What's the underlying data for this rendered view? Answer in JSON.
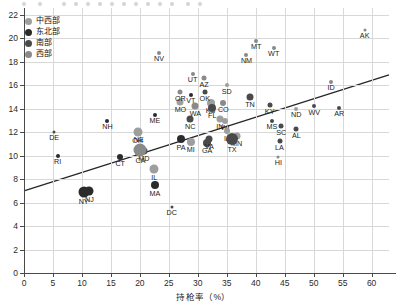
{
  "legend": {
    "position": "top-left",
    "items": [
      {
        "label": "中西部",
        "color": "#9e9e9e",
        "size": 7
      },
      {
        "label": "东北部",
        "color": "#2b2b2b",
        "size": 7
      },
      {
        "label": "南部",
        "color": "#4a4a4a",
        "size": 7
      },
      {
        "label": "西部",
        "color": "#8a8a8a",
        "size": 7
      }
    ]
  },
  "axes": {
    "x": {
      "title": "持枪率（%）",
      "min": 0,
      "max": 63,
      "ticks": [
        0,
        5,
        10,
        15,
        20,
        25,
        30,
        35,
        40,
        45,
        50,
        55,
        60
      ],
      "tick_labels": [
        "0",
        "5",
        "10",
        "15",
        "20",
        "25",
        "30",
        "35",
        "40",
        "45",
        "50",
        "55",
        "60"
      ]
    },
    "y": {
      "title": "",
      "min": 0,
      "max": 22.6,
      "ticks": [
        0,
        2,
        4,
        6,
        8,
        10,
        12,
        14,
        16,
        18,
        20,
        22
      ],
      "tick_labels": [
        "0",
        "2",
        "4",
        "6",
        "8",
        "10",
        "12",
        "14",
        "16",
        "18",
        "20",
        "22"
      ]
    },
    "grid": true
  },
  "trend_line": {
    "x1": 0,
    "y1": 7.0,
    "x2": 63,
    "y2": 16.9,
    "color": "#262626"
  },
  "chart_data": {
    "type": "scatter",
    "title": "",
    "subtitle": "",
    "xlabel": "持枪率（%）",
    "ylabel": "",
    "xlim": [
      0,
      63
    ],
    "ylim": [
      0,
      22.6
    ],
    "grid": true,
    "legend_position": "top-left",
    "trendline": {
      "x": [
        0,
        63
      ],
      "y": [
        7.0,
        16.9
      ]
    },
    "series": [
      {
        "name": "中西部",
        "color": "#9e9e9e",
        "points": [
          {
            "label": "OH",
            "x": 19.6,
            "y": 12.0,
            "size": 9
          },
          {
            "label": "IL",
            "x": 22.5,
            "y": 8.9,
            "size": 9
          },
          {
            "label": "MO",
            "x": 27.0,
            "y": 14.6,
            "size": 7
          },
          {
            "label": "KS",
            "x": 32.2,
            "y": 14.5,
            "size": 8
          },
          {
            "label": "NE",
            "x": 19.8,
            "y": 11.9,
            "size": 5
          },
          {
            "label": "WI",
            "x": 34.7,
            "y": 13.0,
            "size": 6
          },
          {
            "label": "IN",
            "x": 33.8,
            "y": 13.1,
            "size": 7
          },
          {
            "label": "MI",
            "x": 28.8,
            "y": 11.2,
            "size": 8
          },
          {
            "label": "IA",
            "x": 35.1,
            "y": 12.1,
            "size": 6
          },
          {
            "label": "MN",
            "x": 36.7,
            "y": 11.7,
            "size": 7
          },
          {
            "label": "SD",
            "x": 35.0,
            "y": 16.0,
            "size": 4
          },
          {
            "label": "ND",
            "x": 47.0,
            "y": 14.0,
            "size": 4
          }
        ]
      },
      {
        "name": "东北部",
        "color": "#2b2b2b",
        "points": [
          {
            "label": "NY",
            "x": 10.3,
            "y": 6.9,
            "size": 11
          },
          {
            "label": "NJ",
            "x": 11.3,
            "y": 7.0,
            "size": 9
          },
          {
            "label": "MA",
            "x": 22.6,
            "y": 7.5,
            "size": 8
          },
          {
            "label": "CT",
            "x": 16.6,
            "y": 9.9,
            "size": 6
          },
          {
            "label": "RI",
            "x": 5.8,
            "y": 10.0,
            "size": 4
          },
          {
            "label": "NH",
            "x": 14.4,
            "y": 13.0,
            "size": 4
          },
          {
            "label": "ME",
            "x": 22.6,
            "y": 13.5,
            "size": 4
          },
          {
            "label": "VT",
            "x": 28.8,
            "y": 15.2,
            "size": 4
          },
          {
            "label": "PA",
            "x": 27.1,
            "y": 11.4,
            "size": 8
          }
        ]
      },
      {
        "name": "南部",
        "color": "#4a4a4a",
        "points": [
          {
            "label": "TX",
            "x": 35.9,
            "y": 11.4,
            "size": 12
          },
          {
            "label": "FL",
            "x": 32.5,
            "y": 14.1,
            "size": 8
          },
          {
            "label": "GA",
            "x": 31.6,
            "y": 11.1,
            "size": 8
          },
          {
            "label": "NC",
            "x": 28.7,
            "y": 13.1,
            "size": 7
          },
          {
            "label": "VA",
            "x": 32.0,
            "y": 11.4,
            "size": 7
          },
          {
            "label": "TN",
            "x": 39.0,
            "y": 15.0,
            "size": 7
          },
          {
            "label": "MD",
            "x": 20.7,
            "y": 10.4,
            "size": 7
          },
          {
            "label": "DE",
            "x": 5.2,
            "y": 12.0,
            "size": 3
          },
          {
            "label": "OK",
            "x": 31.2,
            "y": 15.4,
            "size": 5
          },
          {
            "label": "KY",
            "x": 42.4,
            "y": 14.3,
            "size": 5
          },
          {
            "label": "SC",
            "x": 44.4,
            "y": 12.5,
            "size": 5
          },
          {
            "label": "AL",
            "x": 47.0,
            "y": 12.3,
            "size": 5
          },
          {
            "label": "MS",
            "x": 42.8,
            "y": 13.0,
            "size": 4
          },
          {
            "label": "LA",
            "x": 44.1,
            "y": 11.3,
            "size": 5
          },
          {
            "label": "AR",
            "x": 54.4,
            "y": 14.1,
            "size": 4
          },
          {
            "label": "WV",
            "x": 50.1,
            "y": 14.2,
            "size": 4
          },
          {
            "label": "DC",
            "x": 25.5,
            "y": 5.6,
            "size": 3
          }
        ]
      },
      {
        "name": "西部",
        "color": "#8a8a8a",
        "points": [
          {
            "label": "CA",
            "x": 20.1,
            "y": 10.5,
            "size": 13
          },
          {
            "label": "WA",
            "x": 29.6,
            "y": 14.2,
            "size": 7
          },
          {
            "label": "CO",
            "x": 34.4,
            "y": 14.5,
            "size": 6
          },
          {
            "label": "OR",
            "x": 27.0,
            "y": 15.4,
            "size": 5
          },
          {
            "label": "AZ",
            "x": 31.1,
            "y": 16.6,
            "size": 5
          },
          {
            "label": "UT",
            "x": 29.1,
            "y": 17.0,
            "size": 4
          },
          {
            "label": "NV",
            "x": 23.3,
            "y": 18.8,
            "size": 4
          },
          {
            "label": "NM",
            "x": 38.4,
            "y": 18.6,
            "size": 4
          },
          {
            "label": "MT",
            "x": 40.1,
            "y": 19.8,
            "size": 4
          },
          {
            "label": "WT",
            "x": 43.1,
            "y": 19.2,
            "size": 4
          },
          {
            "label": "ID",
            "x": 53.0,
            "y": 16.3,
            "size": 4
          },
          {
            "label": "AK",
            "x": 58.8,
            "y": 20.7,
            "size": 3
          },
          {
            "label": "HI",
            "x": 43.9,
            "y": 9.9,
            "size": 3
          }
        ]
      }
    ]
  }
}
